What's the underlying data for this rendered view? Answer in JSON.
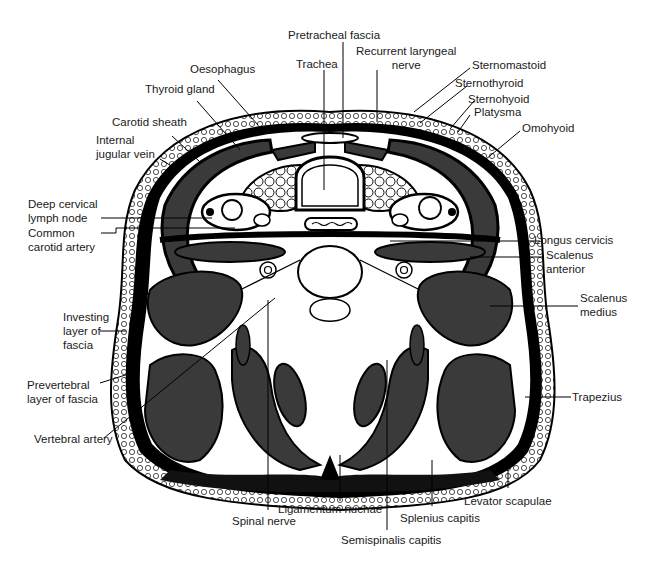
{
  "figure": {
    "colors": {
      "muscle": "#3a3a3a",
      "fascia": "#000000",
      "background": "#ffffff",
      "adipose": "#f4f4f4"
    }
  },
  "labels": {
    "pretracheal_fascia": "Pretracheal fascia",
    "recurrent_laryngeal_nerve_1": "Recurrent laryngeal",
    "recurrent_laryngeal_nerve_2": "nerve",
    "trachea": "Trachea",
    "oesophagus": "Oesophagus",
    "thyroid_gland": "Thyroid gland",
    "carotid_sheath": "Carotid sheath",
    "internal_jugular_vein_1": "Internal",
    "internal_jugular_vein_2": "jugular vein",
    "deep_cervical_lymph_node_1": "Deep cervical",
    "deep_cervical_lymph_node_2": "lymph node",
    "common_carotid_artery_1": "Common",
    "common_carotid_artery_2": "carotid artery",
    "sternomastoid": "Sternomastoid",
    "sternothyroid": "Sternothyroid",
    "sternohyoid": "Sternohyoid",
    "platysma": "Platysma",
    "omohyoid": "Omohyoid",
    "longus_cervicis": "Longus cervicis",
    "scalenus_anterior_1": "Scalenus",
    "scalenus_anterior_2": "anterior",
    "scalenus_medius_1": "Scalenus",
    "scalenus_medius_2": "medius",
    "investing_layer_1": "Investing",
    "investing_layer_2": "layer of",
    "investing_layer_3": "fascia",
    "prevertebral_layer_1": "Prevertebral",
    "prevertebral_layer_2": "layer of fascia",
    "vertebral_artery": "Vertebral artery",
    "trapezius": "Trapezius",
    "levator_scapulae": "Levator scapulae",
    "splenius_capitis": "Splenius capitis",
    "semispinalis_capitis": "Semispinalis capitis",
    "ligamentum_nuchae": "Ligamentum nuchae",
    "spinal_nerve": "Spinal nerve"
  }
}
